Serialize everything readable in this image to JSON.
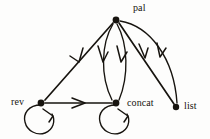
{
  "diagram": {
    "type": "directed-graph",
    "background_color": "#fdfdfc",
    "ink_color": "#17140f",
    "nodes": [
      {
        "id": "pal",
        "label": "pal",
        "x": 116,
        "y": 20,
        "label_x": 133,
        "label_y": 3
      },
      {
        "id": "rev",
        "label": "rev",
        "x": 41,
        "y": 103,
        "label_x": 11,
        "label_y": 97
      },
      {
        "id": "concat",
        "label": "concat",
        "x": 116,
        "y": 103,
        "label_x": 127,
        "label_y": 98
      },
      {
        "id": "list",
        "label": "list",
        "x": 176,
        "y": 107,
        "label_x": 184,
        "label_y": 101
      }
    ],
    "edges": [
      {
        "from": "pal",
        "to": "rev",
        "style": "straight",
        "label": ""
      },
      {
        "from": "pal",
        "to": "concat",
        "style": "curve-left",
        "label": ""
      },
      {
        "from": "pal",
        "to": "concat",
        "style": "curve-right",
        "label": ""
      },
      {
        "from": "pal",
        "to": "list",
        "style": "straight",
        "label": ""
      },
      {
        "from": "pal",
        "to": "list",
        "style": "curve-outer",
        "label": ""
      },
      {
        "from": "rev",
        "to": "concat",
        "style": "straight",
        "label": ""
      },
      {
        "from": "rev",
        "to": "rev",
        "style": "self-loop",
        "label": ""
      },
      {
        "from": "concat",
        "to": "concat",
        "style": "self-loop",
        "label": ""
      }
    ]
  }
}
